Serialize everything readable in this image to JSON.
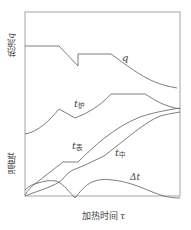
{
  "diagram": {
    "type": "line-schematic",
    "axes": {
      "x_label_prefix": "加热时间",
      "x_label_symbol": "τ",
      "y_top_label_prefix": "热流",
      "y_top_label_symbol": "q",
      "y_bottom_label_prefix": "温度",
      "y_bottom_label_symbol": "t"
    },
    "curves": [
      {
        "id": "q",
        "symbol": "q",
        "subscript": "",
        "description": "热流"
      },
      {
        "id": "t_furnace",
        "symbol": "t",
        "subscript": "炉",
        "description": "炉温"
      },
      {
        "id": "t_surface",
        "symbol": "t",
        "subscript": "表",
        "description": "表面温度"
      },
      {
        "id": "t_center",
        "symbol": "t",
        "subscript": "中",
        "description": "中心温度"
      },
      {
        "id": "delta_t",
        "symbol": "Δt",
        "subscript": "",
        "description": "温差"
      }
    ],
    "colors": {
      "frame": "#9a9a9a",
      "curve": "#6e6e6e",
      "text": "#444444"
    }
  }
}
